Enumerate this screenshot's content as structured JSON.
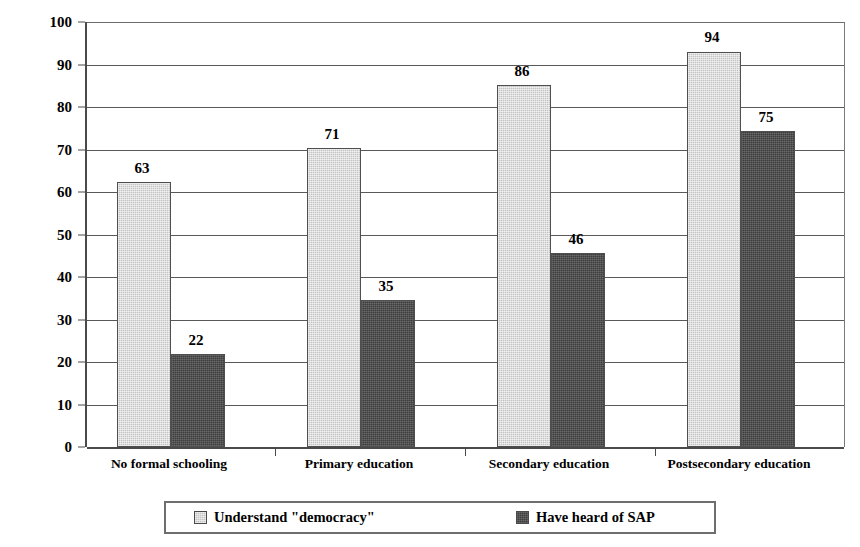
{
  "chart_data": {
    "type": "bar",
    "title": "",
    "subtitle": "",
    "xlabel": "",
    "ylabel": "Percent",
    "ylim": [
      0,
      100
    ],
    "ytick_step": 10,
    "yticks": [
      0,
      10,
      20,
      30,
      40,
      50,
      60,
      70,
      80,
      90,
      100
    ],
    "ytick_labels": [
      "0",
      "10",
      "20",
      "30",
      "40",
      "50",
      "60",
      "70",
      "80",
      "90",
      "100"
    ],
    "grid": true,
    "grid_axis": "y",
    "legend_position": "bottom",
    "bar_value_labels": true,
    "categories": [
      "No formal schooling",
      "Primary education",
      "Secondary education",
      "Postsecondary education"
    ],
    "series": [
      {
        "name": "Understand \"democracy\"",
        "color": "#c3c3c3",
        "values": [
          63,
          71,
          86,
          94
        ],
        "value_labels": [
          "63",
          "71",
          "86",
          "94"
        ]
      },
      {
        "name": "Have heard of SAP",
        "color": "#3d3d3d",
        "values": [
          22,
          35,
          46,
          75
        ],
        "value_labels": [
          "22",
          "35",
          "46",
          "75"
        ]
      }
    ],
    "annotations": []
  },
  "legend": {
    "entries": [
      {
        "label": "Understand \"democracy\""
      },
      {
        "label": "Have heard of SAP"
      }
    ]
  },
  "colors": {
    "series_a": "#c3c3c3",
    "series_b": "#3d3d3d",
    "gridline": "#595959",
    "axis": "#4a4a4a",
    "text": "#000000",
    "background": "#ffffff"
  }
}
